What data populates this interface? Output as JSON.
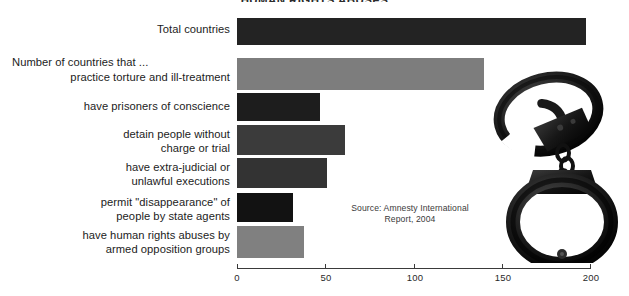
{
  "title": "HUMAN RIGHTS ABUSES",
  "source_note": "Source: Amnesty International\nReport, 2004",
  "decor": {
    "handcuffs_icon": "handcuffs-photo"
  },
  "axis": {
    "ticks": [
      "0",
      "50",
      "100",
      "150",
      "200"
    ],
    "min": 0,
    "max": 200
  },
  "group_header": "Number of countries that ...",
  "chart_data": {
    "type": "bar",
    "orientation": "horizontal",
    "title": "HUMAN RIGHTS ABUSES",
    "xlabel": "",
    "ylabel": "",
    "xlim": [
      0,
      200
    ],
    "grid": false,
    "legend": "none",
    "annotations": [
      "Number of countries that ...",
      "Source: Amnesty International Report, 2004"
    ],
    "categories": [
      "Total countries",
      "practice torture and ill-treatment",
      "have prisoners of conscience",
      "detain people without\ncharge or trial",
      "have extra-judicial or\nunlawful executions",
      "permit \"disappearance\" of\npeople by state agents",
      "have human rights abuses by\narmed opposition groups"
    ],
    "values": [
      198,
      140,
      47,
      61,
      51,
      32,
      38
    ],
    "colors": [
      "#232323",
      "#7d7d7d",
      "#1d1d1d",
      "#3b3b3b",
      "#333333",
      "#121212",
      "#808080"
    ]
  },
  "bars": [
    {
      "label": "Total countries",
      "value": 198,
      "color": "#232323",
      "top": 18,
      "height": 27
    },
    {
      "label": "practice torture and ill-treatment",
      "value": 140,
      "color": "#7d7d7d",
      "top": 58,
      "height": 32
    },
    {
      "label": "have prisoners of conscience",
      "value": 47,
      "color": "#1d1d1d",
      "top": 93,
      "height": 28
    },
    {
      "label": "detain people without\ncharge or trial",
      "value": 61,
      "color": "#3b3b3b",
      "top": 125,
      "height": 30
    },
    {
      "label": "have extra-judicial or\nunlawful executions",
      "value": 51,
      "color": "#333333",
      "top": 158,
      "height": 30
    },
    {
      "label": "permit \"disappearance\" of\npeople by state agents",
      "value": 32,
      "color": "#121212",
      "top": 193,
      "height": 29
    },
    {
      "label": "have human rights abuses by\narmed opposition groups",
      "value": 38,
      "color": "#808080",
      "top": 226,
      "height": 32
    }
  ]
}
